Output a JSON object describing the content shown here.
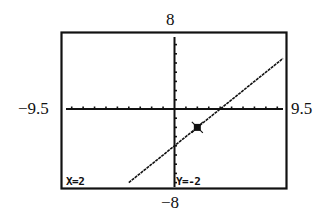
{
  "window": {
    "xmin": "-9.5",
    "xmax": "9.5",
    "ymin": "-8",
    "ymax": "8",
    "xmin_label": "−9.5",
    "xmax_label": "9.5",
    "ymin_label": "−8",
    "ymax_label": "8"
  },
  "trace": {
    "x_readout": "X=2",
    "y_readout": "Y=-2",
    "cursor": {
      "x": 2,
      "y": -2
    }
  },
  "colors": {
    "ink": "#111111",
    "background": "#ffffff"
  },
  "chart_data": {
    "type": "line",
    "title": "",
    "xlabel": "",
    "ylabel": "",
    "xlim": [
      -9.5,
      9.5
    ],
    "ylim": [
      -8,
      8
    ],
    "xscale_tick": 1,
    "yscale_tick": 1,
    "grid": false,
    "series": [
      {
        "name": "y = x - 4",
        "x": [
          -4,
          -2,
          0,
          2,
          4,
          6,
          8,
          9.5
        ],
        "y": [
          -8,
          -6,
          -4,
          -2,
          0,
          2,
          4,
          5.5
        ]
      }
    ],
    "annotations": [
      {
        "type": "trace-cursor",
        "x": 2,
        "y": -2,
        "text": "X=2  Y=-2"
      }
    ],
    "axis_labels": {
      "left": "-9.5",
      "right": "9.5",
      "top": "8",
      "bottom": "-8"
    }
  }
}
